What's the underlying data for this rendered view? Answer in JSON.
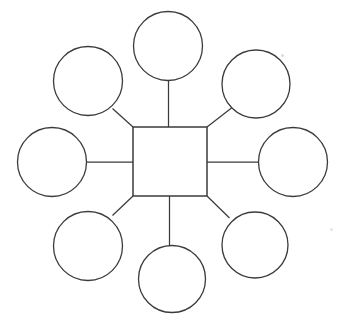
{
  "page": {
    "background_color": "#ffffff",
    "width": 342,
    "height": 329
  },
  "diagram": {
    "type": "spider-web-graphic-organizer",
    "stroke_color": "#3b3b3b",
    "fill_color": "#ffffff",
    "center": {
      "shape": "square",
      "label": "",
      "x": 133,
      "y": 127,
      "width": 74,
      "height": 69,
      "center_x": 170,
      "center_y": 161.5
    },
    "nodes": [
      {
        "id": "node-top",
        "label": "",
        "position": "top",
        "cx": 168,
        "cy": 46,
        "r": 34.5,
        "connector": "orthogonal-vertical"
      },
      {
        "id": "node-top-left",
        "label": "",
        "position": "top-left",
        "cx": 88,
        "cy": 81,
        "r": 34.5,
        "connector": "diagonal"
      },
      {
        "id": "node-top-right",
        "label": "",
        "position": "top-right",
        "cx": 256,
        "cy": 84,
        "r": 34.0,
        "connector": "diagonal"
      },
      {
        "id": "node-left",
        "label": "",
        "position": "left",
        "cx": 52,
        "cy": 162,
        "r": 34.5,
        "connector": "orthogonal-horizontal"
      },
      {
        "id": "node-right",
        "label": "",
        "position": "right",
        "cx": 293,
        "cy": 162,
        "r": 34.5,
        "connector": "orthogonal-horizontal"
      },
      {
        "id": "node-bottom-left",
        "label": "",
        "position": "bottom-left",
        "cx": 88,
        "cy": 246,
        "r": 34.5,
        "connector": "diagonal"
      },
      {
        "id": "node-bottom-right",
        "label": "",
        "position": "bottom-right",
        "cx": 255,
        "cy": 245,
        "r": 33.0,
        "connector": "diagonal"
      },
      {
        "id": "node-bottom",
        "label": "",
        "position": "bottom",
        "cx": 172,
        "cy": 279,
        "r": 33.5,
        "connector": "orthogonal-vertical"
      }
    ],
    "connectors": [
      {
        "id": "connector-top",
        "from": "center",
        "to": "node-top",
        "x1": 168.5,
        "y1": 127,
        "x2": 168.5,
        "y2": 80.5
      },
      {
        "id": "connector-top-left",
        "from": "center",
        "to": "node-top-left",
        "x1": 133,
        "y1": 127,
        "x2": 112.5,
        "y2": 108.5
      },
      {
        "id": "connector-top-right",
        "from": "center",
        "to": "node-top-right",
        "x1": 207,
        "y1": 127,
        "x2": 231.5,
        "y2": 108
      },
      {
        "id": "connector-left",
        "from": "center",
        "to": "node-left",
        "x1": 133,
        "y1": 162,
        "x2": 86.5,
        "y2": 162
      },
      {
        "id": "connector-right",
        "from": "center",
        "to": "node-right",
        "x1": 207,
        "y1": 162,
        "x2": 258.5,
        "y2": 162
      },
      {
        "id": "connector-bottom-left",
        "from": "center",
        "to": "node-bottom-left",
        "x1": 133,
        "y1": 196,
        "x2": 112.5,
        "y2": 215.5
      },
      {
        "id": "connector-bottom-right",
        "from": "center",
        "to": "node-bottom-right",
        "x1": 207,
        "y1": 196,
        "x2": 229.5,
        "y2": 218
      },
      {
        "id": "connector-bottom",
        "from": "center",
        "to": "node-bottom",
        "x1": 169.5,
        "y1": 196,
        "x2": 169.5,
        "y2": 245.5
      }
    ]
  }
}
